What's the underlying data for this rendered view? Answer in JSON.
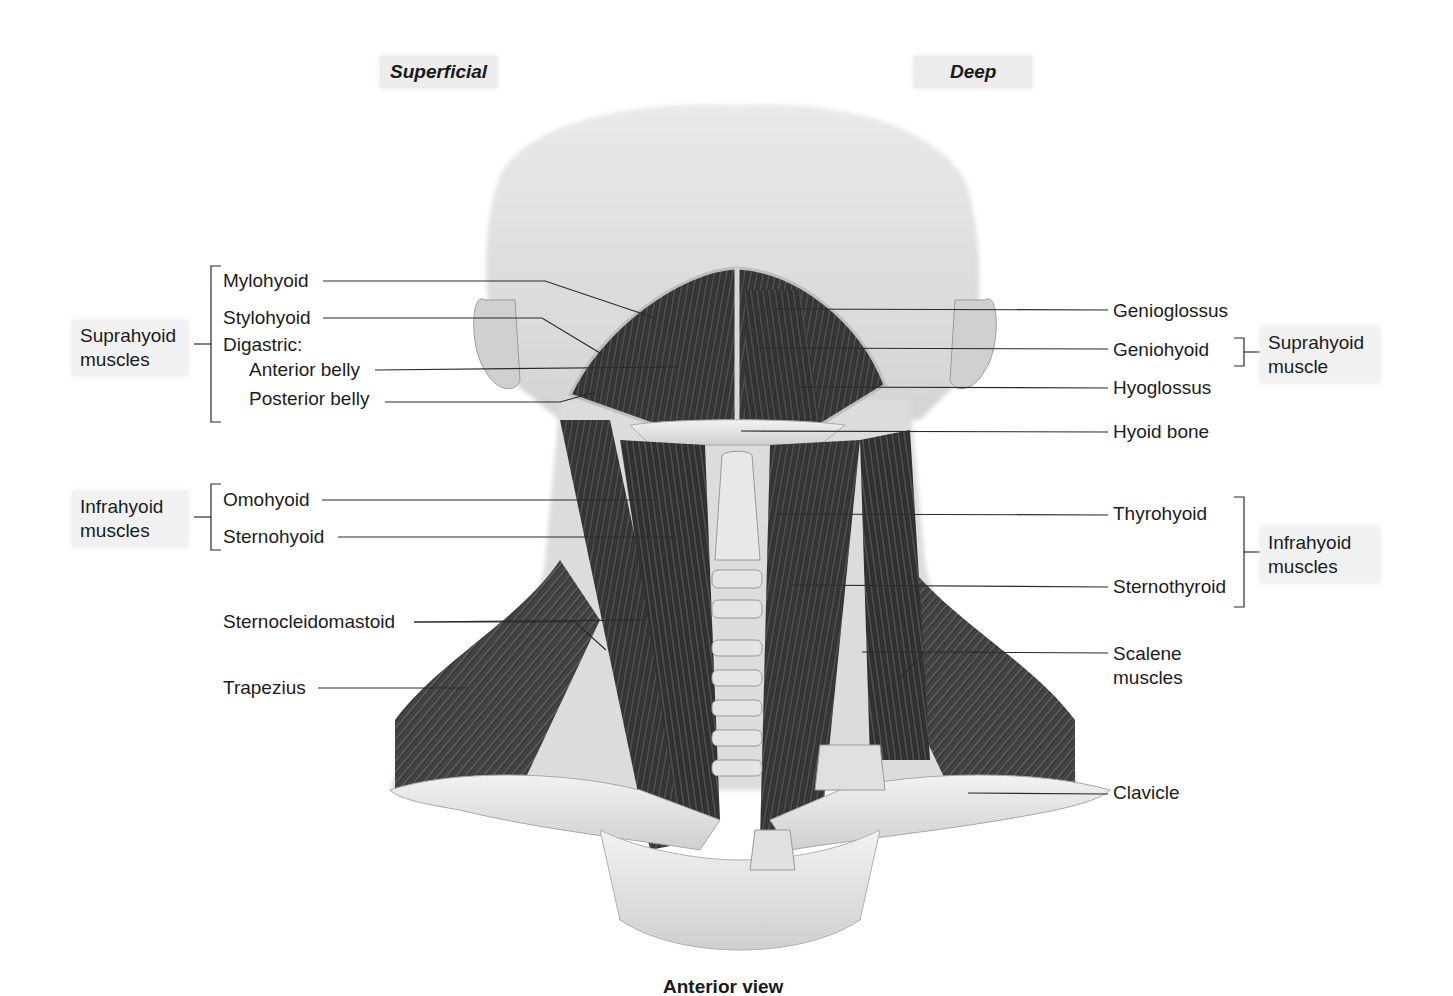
{
  "headings": {
    "left": "Superficial",
    "right": "Deep"
  },
  "caption": "Anterior view",
  "groups": {
    "left_suprahyoid": "Suprahyoid muscles",
    "left_infrahyoid": "Infrahyoid muscles",
    "right_suprahyoid": "Suprahyoid muscle",
    "right_infrahyoid": "Infrahyoid muscles"
  },
  "left_labels": {
    "mylohyoid": "Mylohyoid",
    "stylohyoid": "Stylohyoid",
    "digastric": "Digastric:",
    "anterior_belly": "Anterior belly",
    "posterior_belly": "Posterior belly",
    "omohyoid": "Omohyoid",
    "sternohyoid": "Sternohyoid",
    "sternocleidomastoid": "Sternocleidomastoid",
    "trapezius": "Trapezius"
  },
  "right_labels": {
    "genioglossus": "Genioglossus",
    "geniohyoid": "Geniohyoid",
    "hyoglossus": "Hyoglossus",
    "hyoid_bone": "Hyoid bone",
    "thyrohyoid": "Thyrohyoid",
    "sternothyroid": "Sternothyroid",
    "scalene": "Scalene muscles",
    "clavicle": "Clavicle"
  },
  "colors": {
    "label_box": "#f1f1f1",
    "heading_box": "#ececec",
    "muscle_dark": "#2b2b2b",
    "bone": "#e6e6e6"
  }
}
